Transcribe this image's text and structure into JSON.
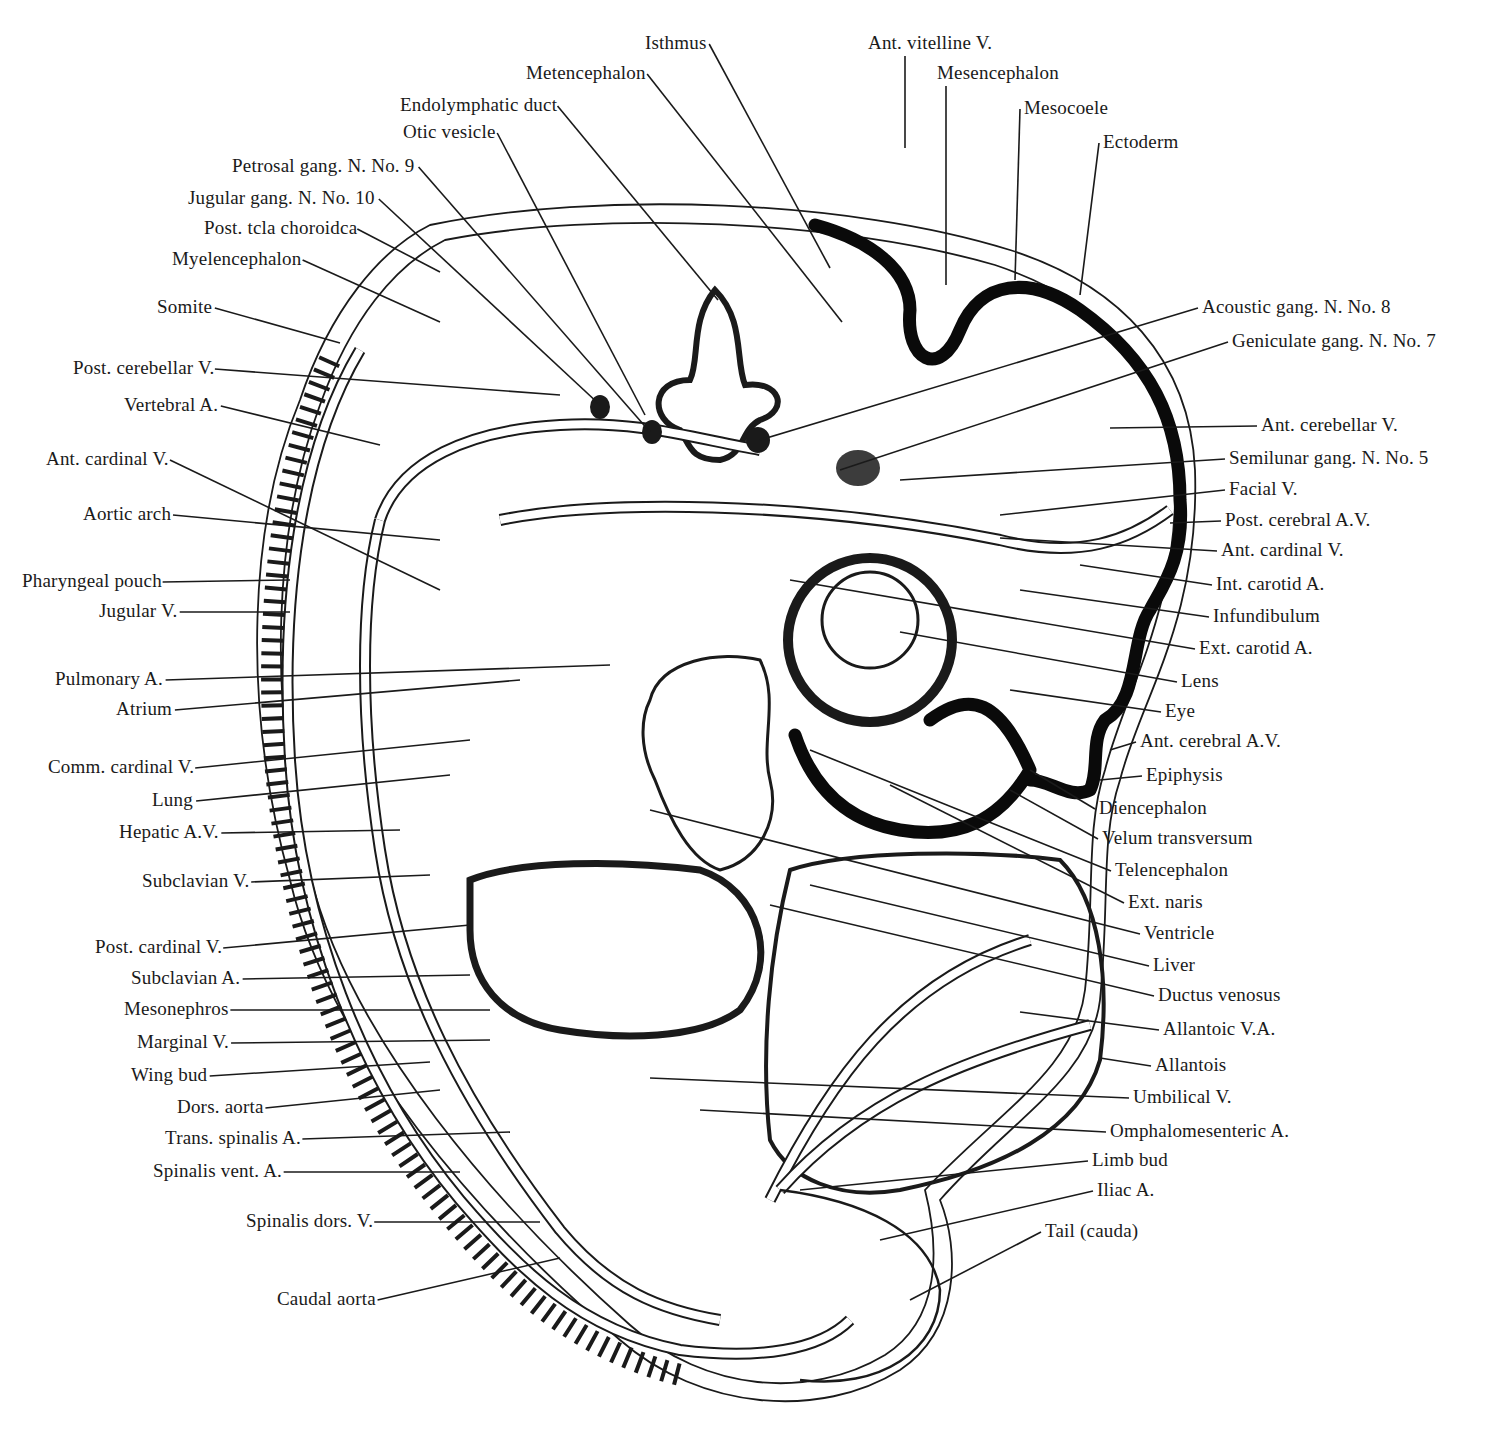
{
  "figure": {
    "labels": [
      {
        "id": "isthmus",
        "text": "Isthmus",
        "x": 645,
        "y": 36,
        "align": "left",
        "tip": [
          830,
          268
        ]
      },
      {
        "id": "metencephalon",
        "text": "Metencephalon",
        "x": 526,
        "y": 66,
        "align": "left",
        "tip": [
          842,
          322
        ]
      },
      {
        "id": "endolymphatic-duct",
        "text": "Endolymphatic duct",
        "x": 400,
        "y": 98,
        "align": "left",
        "tip": [
          718,
          300
        ]
      },
      {
        "id": "otic-vesicle",
        "text": "Otic vesicle",
        "x": 403,
        "y": 125,
        "align": "left",
        "tip": [
          645,
          415
        ]
      },
      {
        "id": "petrosal-gang",
        "text": "Petrosal gang. N.  No. 9",
        "x": 232,
        "y": 159,
        "align": "left",
        "tip": [
          650,
          432
        ]
      },
      {
        "id": "jugular-gang",
        "text": "Jugular gang. N.  No. 10",
        "x": 188,
        "y": 191,
        "align": "left",
        "tip": [
          600,
          405
        ]
      },
      {
        "id": "post-tela-choroidea",
        "text": "Post. tcla choroidca",
        "x": 204,
        "y": 221,
        "align": "left",
        "tip": [
          440,
          272
        ]
      },
      {
        "id": "myelencephalon",
        "text": "Myelencephalon",
        "x": 172,
        "y": 252,
        "align": "left",
        "tip": [
          440,
          322
        ]
      },
      {
        "id": "ant-vitelline-v",
        "text": "Ant. vitelline V.",
        "x": 868,
        "y": 36,
        "align": "left",
        "tip": [
          905,
          148
        ]
      },
      {
        "id": "mesencephalon",
        "text": "Mesencephalon",
        "x": 937,
        "y": 66,
        "align": "left",
        "tip": [
          946,
          285
        ]
      },
      {
        "id": "mesocoele",
        "text": "Mesocoele",
        "x": 1024,
        "y": 101,
        "align": "left",
        "tip": [
          1015,
          280
        ]
      },
      {
        "id": "ectoderm",
        "text": "Ectoderm",
        "x": 1103,
        "y": 135,
        "align": "left",
        "tip": [
          1080,
          295
        ]
      },
      {
        "id": "somite",
        "text": "Somite",
        "x": 157,
        "y": 300,
        "align": "left",
        "tip": [
          340,
          343
        ]
      },
      {
        "id": "post-cerebellar-v",
        "text": "Post. cerebellar V.",
        "x": 73,
        "y": 361,
        "align": "left",
        "tip": [
          560,
          395
        ]
      },
      {
        "id": "vertebral-a",
        "text": "Vertebral A.",
        "x": 124,
        "y": 398,
        "align": "left",
        "tip": [
          380,
          445
        ]
      },
      {
        "id": "ant-cardinal-v-left",
        "text": "Ant. cardinal V.",
        "x": 46,
        "y": 452,
        "align": "left",
        "tip": [
          440,
          590
        ]
      },
      {
        "id": "aortic-arch",
        "text": "Aortic arch",
        "x": 83,
        "y": 507,
        "align": "left",
        "tip": [
          440,
          540
        ]
      },
      {
        "id": "pharyngeal-pouch",
        "text": "Pharyngeal pouch",
        "x": 22,
        "y": 574,
        "align": "left",
        "tip": [
          290,
          580
        ]
      },
      {
        "id": "jugular-v",
        "text": "Jugular V.",
        "x": 99,
        "y": 604,
        "align": "left",
        "tip": [
          290,
          612
        ]
      },
      {
        "id": "pulmonary-a",
        "text": "Pulmonary A.",
        "x": 55,
        "y": 672,
        "align": "left",
        "tip": [
          610,
          665
        ]
      },
      {
        "id": "atrium",
        "text": "Atrium",
        "x": 116,
        "y": 702,
        "align": "left",
        "tip": [
          520,
          680
        ]
      },
      {
        "id": "comm-cardinal-v",
        "text": "Comm. cardinal V.",
        "x": 48,
        "y": 760,
        "align": "left",
        "tip": [
          470,
          740
        ]
      },
      {
        "id": "lung",
        "text": "Lung",
        "x": 152,
        "y": 793,
        "align": "left",
        "tip": [
          450,
          775
        ]
      },
      {
        "id": "hepatic-av",
        "text": "Hepatic A.V.",
        "x": 119,
        "y": 825,
        "align": "left",
        "tip": [
          400,
          830
        ]
      },
      {
        "id": "subclavian-v",
        "text": "Subclavian V.",
        "x": 142,
        "y": 874,
        "align": "left",
        "tip": [
          430,
          875
        ]
      },
      {
        "id": "post-cardinal-v",
        "text": "Post. cardinal V.",
        "x": 95,
        "y": 940,
        "align": "left",
        "tip": [
          470,
          925
        ]
      },
      {
        "id": "subclavian-a",
        "text": "Subclavian A.",
        "x": 131,
        "y": 971,
        "align": "left",
        "tip": [
          470,
          975
        ]
      },
      {
        "id": "mesonephros",
        "text": "Mesonephros",
        "x": 124,
        "y": 1002,
        "align": "left",
        "tip": [
          490,
          1010
        ]
      },
      {
        "id": "marginal-v",
        "text": "Marginal V.",
        "x": 137,
        "y": 1035,
        "align": "left",
        "tip": [
          490,
          1040
        ]
      },
      {
        "id": "wing-bud",
        "text": "Wing bud",
        "x": 131,
        "y": 1068,
        "align": "left",
        "tip": [
          430,
          1062
        ]
      },
      {
        "id": "dors-aorta",
        "text": "Dors. aorta",
        "x": 177,
        "y": 1100,
        "align": "left",
        "tip": [
          440,
          1090
        ]
      },
      {
        "id": "trans-spinalis-a",
        "text": "Trans. spinalis A.",
        "x": 165,
        "y": 1131,
        "align": "left",
        "tip": [
          510,
          1132
        ]
      },
      {
        "id": "spinalis-vent-a",
        "text": "Spinalis vent. A.",
        "x": 153,
        "y": 1164,
        "align": "left",
        "tip": [
          460,
          1172
        ]
      },
      {
        "id": "spinalis-dors-v",
        "text": "Spinalis dors. V.",
        "x": 246,
        "y": 1214,
        "align": "left",
        "tip": [
          540,
          1222
        ]
      },
      {
        "id": "caudal-aorta",
        "text": "Caudal aorta",
        "x": 277,
        "y": 1292,
        "align": "left",
        "tip": [
          560,
          1258
        ]
      },
      {
        "id": "acoustic-gang",
        "text": "Acoustic gang. N.  No. 8",
        "x": 1202,
        "y": 300,
        "align": "left",
        "tip": [
          760,
          440
        ]
      },
      {
        "id": "geniculate-gang",
        "text": "Geniculate gang. N.  No. 7",
        "x": 1232,
        "y": 334,
        "align": "left",
        "tip": [
          840,
          470
        ]
      },
      {
        "id": "ant-cerebellar-v",
        "text": "Ant. cerebellar V.",
        "x": 1261,
        "y": 418,
        "align": "left",
        "tip": [
          1110,
          428
        ]
      },
      {
        "id": "semilunar-gang",
        "text": "Semilunar gang. N.  No. 5",
        "x": 1229,
        "y": 451,
        "align": "left",
        "tip": [
          900,
          480
        ]
      },
      {
        "id": "facial-v",
        "text": "Facial V.",
        "x": 1229,
        "y": 482,
        "align": "left",
        "tip": [
          1000,
          515
        ]
      },
      {
        "id": "post-cerebral-av",
        "text": "Post. cerebral A.V.",
        "x": 1225,
        "y": 513,
        "align": "left",
        "tip": [
          1170,
          523
        ]
      },
      {
        "id": "ant-cardinal-v-right",
        "text": "Ant. cardinal V.",
        "x": 1221,
        "y": 543,
        "align": "left",
        "tip": [
          1000,
          538
        ]
      },
      {
        "id": "int-carotid-a",
        "text": "Int. carotid A.",
        "x": 1216,
        "y": 577,
        "align": "left",
        "tip": [
          1080,
          565
        ]
      },
      {
        "id": "infundibulum",
        "text": "Infundibulum",
        "x": 1213,
        "y": 609,
        "align": "left",
        "tip": [
          1020,
          590
        ]
      },
      {
        "id": "ext-carotid-a",
        "text": "Ext. carotid A.",
        "x": 1199,
        "y": 641,
        "align": "left",
        "tip": [
          790,
          580
        ]
      },
      {
        "id": "lens",
        "text": "Lens",
        "x": 1181,
        "y": 674,
        "align": "left",
        "tip": [
          900,
          632
        ]
      },
      {
        "id": "eye",
        "text": "Eye",
        "x": 1165,
        "y": 704,
        "align": "left",
        "tip": [
          1010,
          690
        ]
      },
      {
        "id": "ant-cerebral-av",
        "text": "Ant. cerebral A.V.",
        "x": 1140,
        "y": 734,
        "align": "left",
        "tip": [
          1110,
          750
        ]
      },
      {
        "id": "epiphysis",
        "text": "Epiphysis",
        "x": 1146,
        "y": 768,
        "align": "left",
        "tip": [
          1100,
          780
        ]
      },
      {
        "id": "diencephalon",
        "text": "Diencephalon",
        "x": 1099,
        "y": 801,
        "align": "left",
        "tip": [
          1030,
          770
        ]
      },
      {
        "id": "velum-transversum",
        "text": "Velum transversum",
        "x": 1102,
        "y": 831,
        "align": "left",
        "tip": [
          1010,
          790
        ]
      },
      {
        "id": "telencephalon",
        "text": "Telencephalon",
        "x": 1115,
        "y": 863,
        "align": "left",
        "tip": [
          810,
          750
        ]
      },
      {
        "id": "ext-naris",
        "text": "Ext. naris",
        "x": 1128,
        "y": 895,
        "align": "left",
        "tip": [
          890,
          785
        ]
      },
      {
        "id": "ventricle",
        "text": "Ventricle",
        "x": 1144,
        "y": 926,
        "align": "left",
        "tip": [
          650,
          810
        ]
      },
      {
        "id": "liver",
        "text": "Liver",
        "x": 1153,
        "y": 958,
        "align": "left",
        "tip": [
          810,
          885
        ]
      },
      {
        "id": "ductus-venosus",
        "text": "Ductus venosus",
        "x": 1158,
        "y": 988,
        "align": "left",
        "tip": [
          770,
          905
        ]
      },
      {
        "id": "allantoic-va",
        "text": "Allantoic V.A.",
        "x": 1163,
        "y": 1022,
        "align": "left",
        "tip": [
          1020,
          1012
        ]
      },
      {
        "id": "allantois",
        "text": "Allantois",
        "x": 1155,
        "y": 1058,
        "align": "left",
        "tip": [
          1100,
          1058
        ]
      },
      {
        "id": "umbilical-v",
        "text": "Umbilical V.",
        "x": 1133,
        "y": 1090,
        "align": "left",
        "tip": [
          650,
          1078
        ]
      },
      {
        "id": "omphalomesenteric-a",
        "text": "Omphalomesenteric A.",
        "x": 1110,
        "y": 1124,
        "align": "left",
        "tip": [
          700,
          1110
        ]
      },
      {
        "id": "limb-bud",
        "text": "Limb bud",
        "x": 1092,
        "y": 1153,
        "align": "left",
        "tip": [
          800,
          1190
        ]
      },
      {
        "id": "iliac-a",
        "text": "Iliac A.",
        "x": 1097,
        "y": 1183,
        "align": "left",
        "tip": [
          880,
          1240
        ]
      },
      {
        "id": "tail-cauda",
        "text": "Tail (cauda)",
        "x": 1045,
        "y": 1224,
        "align": "left",
        "tip": [
          910,
          1300
        ]
      }
    ]
  }
}
